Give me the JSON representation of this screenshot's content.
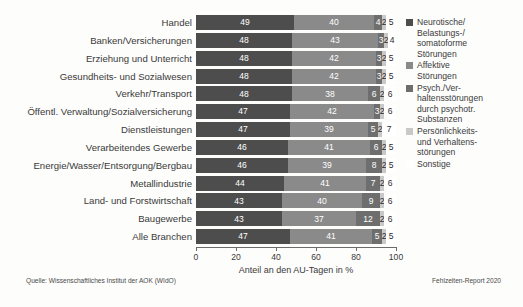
{
  "chart_data": {
    "type": "bar",
    "subtype": "stacked-horizontal-100",
    "title": "",
    "xlabel": "Anteil an den AU-Tagen in %",
    "ylabel": "",
    "xlim": [
      0,
      100
    ],
    "xticks": [
      0,
      20,
      40,
      60,
      80,
      100
    ],
    "grid": false,
    "legend_position": "right",
    "categories": [
      "Handel",
      "Banken/Versicherungen",
      "Erziehung und Unterricht",
      "Gesundheits- und Sozialwesen",
      "Verkehr/Transport",
      "Öffentl. Verwaltung/Sozialversicherung",
      "Dienstleistungen",
      "Verarbeitendes Gewerbe",
      "Energie/Wasser/Entsorgung/Bergbau",
      "Metallindustrie",
      "Land- und Forstwirtschaft",
      "Baugewerbe",
      "Alle Branchen"
    ],
    "series": [
      {
        "name": "Neurotische/Belastungs-/somatoforme Störungen",
        "color": "#4d4d4d",
        "values": [
          49,
          48,
          48,
          48,
          48,
          47,
          47,
          46,
          46,
          44,
          43,
          43,
          47
        ]
      },
      {
        "name": "Affektive Störungen",
        "color": "#8a8a8a",
        "values": [
          40,
          43,
          42,
          42,
          38,
          42,
          39,
          41,
          39,
          41,
          40,
          37,
          41
        ]
      },
      {
        "name": "Psych./Verhaltensstörungen durch psychotr. Substanzen",
        "color": "#6e6e6e",
        "values": [
          4,
          3,
          3,
          3,
          6,
          3,
          5,
          6,
          8,
          7,
          9,
          12,
          5
        ]
      },
      {
        "name": "Persönlichkeits- und Verhaltensstörungen",
        "color": "#c9c9c9",
        "values": [
          2,
          2,
          2,
          2,
          2,
          2,
          2,
          2,
          2,
          2,
          2,
          2,
          2
        ]
      },
      {
        "name": "Sonstige",
        "color": "#ffffff",
        "values": [
          5,
          4,
          5,
          5,
          6,
          6,
          7,
          5,
          5,
          6,
          6,
          6,
          5
        ]
      }
    ]
  },
  "legend": {
    "items": [
      {
        "label": "Neurotische/\nBelastungs-/\nsomatoforme\nStörungen",
        "color": "#4d4d4d"
      },
      {
        "label": "Affektive\nStörungen",
        "color": "#8a8a8a"
      },
      {
        "label": "Psych./Ver-\nhaltensstörungen\ndurch psychotr.\nSubstanzen",
        "color": "#6e6e6e"
      },
      {
        "label": "Persönlichkeits-\nund Verhaltens-\nstörungen",
        "color": "#c9c9c9"
      },
      {
        "label": "Sonstige",
        "color": "#ffffff"
      }
    ]
  },
  "footer": {
    "source": "Quelle: Wissenschaftliches Institut der AOK (WIdO)",
    "report": "Fehlzeiten-Report 2020"
  }
}
